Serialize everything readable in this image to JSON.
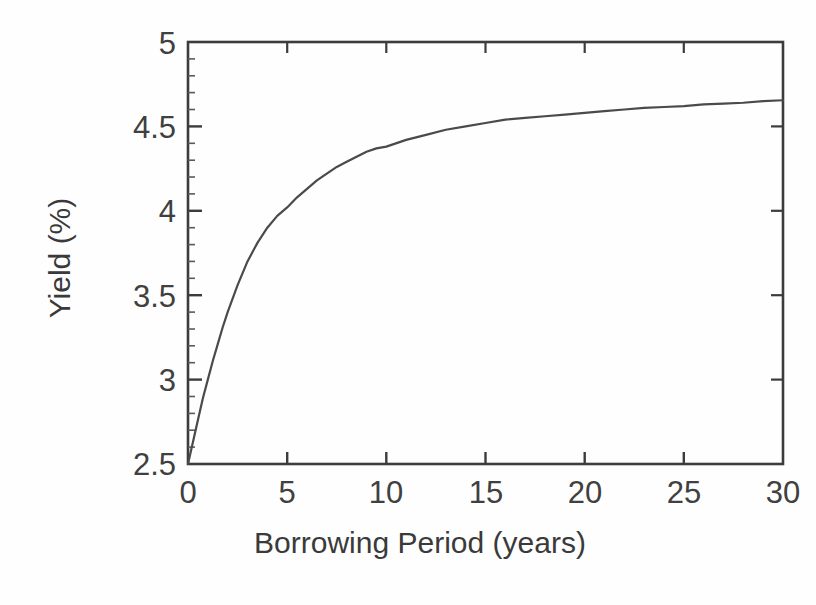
{
  "figure": {
    "background_color": "#fefefe",
    "line_color": "#4a4a4a",
    "axis_color": "#3c3c3c",
    "text_color": "#404040"
  },
  "axes": {
    "x_title": "Borrowing Period (years)",
    "y_title": "Yield (%)",
    "x_ticks": [
      "0",
      "5",
      "10",
      "15",
      "20",
      "25",
      "30"
    ],
    "y_ticks": [
      "5",
      "4.5",
      "4",
      "3.5",
      "3",
      "2.5"
    ]
  },
  "chart_data": {
    "type": "line",
    "title": "",
    "xlabel": "Borrowing Period (years)",
    "ylabel": "Yield (%)",
    "xlim": [
      0,
      30
    ],
    "ylim": [
      2.5,
      5
    ],
    "xticks": [
      0,
      5,
      10,
      15,
      20,
      25,
      30
    ],
    "yticks": [
      2.5,
      3,
      3.5,
      4,
      4.5,
      5
    ],
    "grid": false,
    "legend": null,
    "series": [
      {
        "name": "Yield curve",
        "color": "#4a4a4a",
        "x": [
          0,
          0.25,
          0.5,
          0.75,
          1,
          1.25,
          1.5,
          1.75,
          2,
          2.5,
          3,
          3.5,
          4,
          4.5,
          5,
          5.5,
          6,
          6.5,
          7,
          7.5,
          8,
          8.5,
          9,
          9.5,
          10,
          11,
          12,
          13,
          14,
          15,
          16,
          17,
          18,
          19,
          20,
          21,
          22,
          23,
          24,
          25,
          26,
          27,
          28,
          29,
          30
        ],
        "y": [
          2.5,
          2.63,
          2.76,
          2.89,
          3.0,
          3.11,
          3.21,
          3.31,
          3.4,
          3.56,
          3.7,
          3.81,
          3.9,
          3.97,
          4.02,
          4.08,
          4.13,
          4.18,
          4.22,
          4.26,
          4.29,
          4.32,
          4.35,
          4.37,
          4.38,
          4.42,
          4.45,
          4.48,
          4.5,
          4.52,
          4.54,
          4.55,
          4.56,
          4.57,
          4.58,
          4.59,
          4.6,
          4.61,
          4.615,
          4.62,
          4.63,
          4.635,
          4.64,
          4.65,
          4.655
        ]
      }
    ]
  }
}
